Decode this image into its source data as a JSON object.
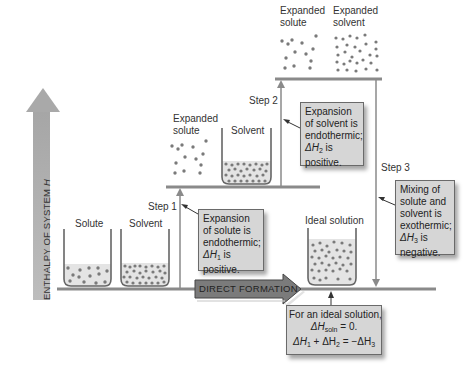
{
  "diagram": {
    "axis": {
      "label": "ENTHALPY OF SYSTEM",
      "label_var": "H",
      "direction": "up"
    },
    "levels": {
      "bottom": {
        "beakers": [
          {
            "label": "Solute"
          },
          {
            "label": "Solvent"
          }
        ],
        "result_beaker": {
          "label": "Ideal solution"
        }
      },
      "middle": {
        "expanded_solute_label_1": "Expanded",
        "expanded_solute_label_2": "solute",
        "beaker_label": "Solvent"
      },
      "top": {
        "expanded_solute_label_1": "Expanded",
        "expanded_solute_label_2": "solute",
        "expanded_solvent_label_1": "Expanded",
        "expanded_solvent_label_2": "solvent"
      }
    },
    "steps": [
      {
        "label": "Step 1",
        "box_lines": [
          "Expansion",
          "of solute is",
          "endothermic;"
        ],
        "delta_prefix": "ΔH",
        "delta_sub": "1",
        "delta_suffix": " is",
        "last_line": "positive."
      },
      {
        "label": "Step 2",
        "box_lines": [
          "Expansion",
          "of solvent is",
          "endothermic;"
        ],
        "delta_prefix": "ΔH",
        "delta_sub": "2",
        "delta_suffix": " is",
        "last_line": "positive."
      },
      {
        "label": "Step 3",
        "box_lines": [
          "Mixing of",
          "solute and",
          "solvent is",
          "exothermic;"
        ],
        "delta_prefix": "ΔH",
        "delta_sub": "3",
        "delta_suffix": " is",
        "last_line": "negative."
      }
    ],
    "direct_formation": {
      "label": "DIRECT FORMATION"
    },
    "ideal_note": {
      "line1": "For an ideal solution,",
      "line2_prefix": "ΔH",
      "line2_sub": "soln",
      "line2_suffix": " = 0.",
      "line3_a": "ΔH",
      "line3_a_sub": "1",
      "line3_b": " + ΔH",
      "line3_b_sub": "2",
      "line3_c": " = −ΔH",
      "line3_c_sub": "3"
    },
    "colors": {
      "arrow_gray": "#a9a9a9",
      "level_line": "#8a8a8a",
      "box_fill": "#d6d6d6",
      "box_border": "#6a6a6a",
      "particle": "#7a7a7a",
      "liquid": "#e6e6e6",
      "direct_arrow": "#7b7b7b"
    }
  }
}
